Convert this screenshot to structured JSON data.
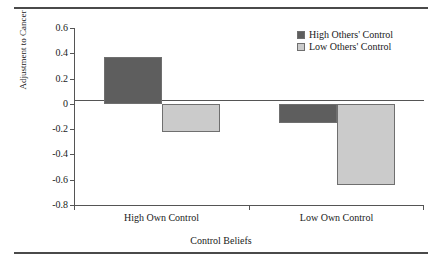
{
  "chart_data": {
    "type": "bar",
    "title": "",
    "xlabel": "Control Beliefs",
    "ylabel": "Adjustment to Cancer",
    "categories": [
      "High Own Control",
      "Low Own Control"
    ],
    "series": [
      {
        "name": "High Others' Control",
        "values": [
          0.37,
          -0.15
        ],
        "color": "#5e5e5e"
      },
      {
        "name": "Low Others' Control",
        "values": [
          -0.22,
          -0.64
        ],
        "color": "#cbcbcb"
      }
    ],
    "ylim": [
      -0.8,
      0.6
    ],
    "yticks": [
      "0.6",
      "0.4",
      "0.2",
      "0",
      "-0.2",
      "-0.4",
      "-0.6",
      "-0.8"
    ],
    "ytick_values": [
      0.6,
      0.4,
      0.2,
      0,
      -0.2,
      -0.4,
      -0.6,
      -0.8
    ],
    "grid": false,
    "zero_line": true,
    "legend_position": "top-right"
  },
  "figure": {
    "top_rule": "",
    "bottom_rule": ""
  }
}
